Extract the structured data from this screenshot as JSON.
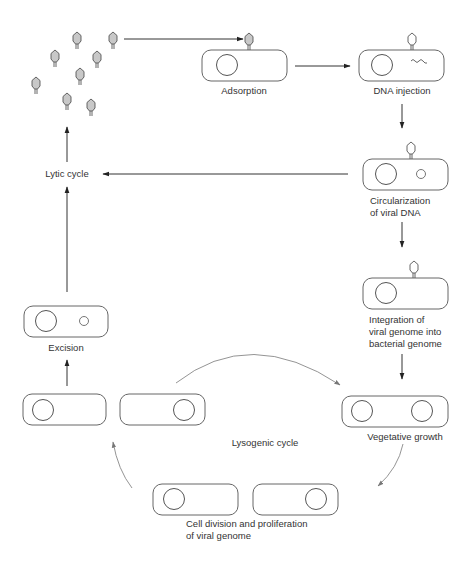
{
  "colors": {
    "stroke": "#555555",
    "cell_stroke": "#666666",
    "phage_fill": "#c8c8c8",
    "phage_empty_fill": "#ffffff",
    "arc_stroke": "#888888",
    "text": "#333333"
  },
  "labels": {
    "adsorption": "Adsorption",
    "dna_injection": "DNA injection",
    "circularization_line1": "Circularization",
    "circularization_line2": "of viral DNA",
    "integration_line1": "Integration of",
    "integration_line2": "viral genome into",
    "integration_line3": "bacterial genome",
    "vegetative_growth": "Vegetative growth",
    "lysogenic_cycle": "Lysogenic cycle",
    "cell_division_line1": "Cell division and proliferation",
    "cell_division_line2": "of viral genome",
    "excision": "Excision",
    "lytic_cycle": "Lytic cycle"
  },
  "nodes": [
    {
      "id": "released-phages",
      "type": "phage-cluster",
      "count": 9
    },
    {
      "id": "adsorption",
      "type": "cell",
      "contents": [
        "nucleoid",
        "attached-phage-full"
      ]
    },
    {
      "id": "dna-injection",
      "type": "cell",
      "contents": [
        "nucleoid",
        "linear-viral-dna",
        "attached-phage-empty"
      ]
    },
    {
      "id": "circularization",
      "type": "cell",
      "contents": [
        "nucleoid",
        "circular-viral-dna",
        "attached-phage-empty"
      ]
    },
    {
      "id": "integration",
      "type": "cell",
      "contents": [
        "nucleoid",
        "attached-phage-empty"
      ]
    },
    {
      "id": "vegetative-growth",
      "type": "cell",
      "contents": [
        "nucleoid",
        "nucleoid"
      ]
    },
    {
      "id": "cell-division",
      "type": "cell-pair"
    },
    {
      "id": "lysogen-pair-left",
      "type": "cell-pair"
    },
    {
      "id": "excision",
      "type": "cell",
      "contents": [
        "nucleoid",
        "circular-viral-dna"
      ]
    },
    {
      "id": "lytic-cycle",
      "type": "label-node"
    }
  ],
  "edges": [
    {
      "from": "released-phages",
      "to": "adsorption"
    },
    {
      "from": "adsorption",
      "to": "dna-injection"
    },
    {
      "from": "dna-injection",
      "to": "circularization"
    },
    {
      "from": "circularization",
      "to": "lytic-cycle"
    },
    {
      "from": "circularization",
      "to": "integration"
    },
    {
      "from": "integration",
      "to": "vegetative-growth"
    },
    {
      "from": "vegetative-growth",
      "to": "cell-division",
      "style": "curved"
    },
    {
      "from": "cell-division",
      "to": "lysogen-pair-left",
      "style": "curved"
    },
    {
      "from": "lysogen-pair-left",
      "to": "vegetative-growth",
      "style": "curved"
    },
    {
      "from": "lysogen-pair-left",
      "to": "excision"
    },
    {
      "from": "excision",
      "to": "lytic-cycle"
    },
    {
      "from": "lytic-cycle",
      "to": "released-phages"
    }
  ]
}
